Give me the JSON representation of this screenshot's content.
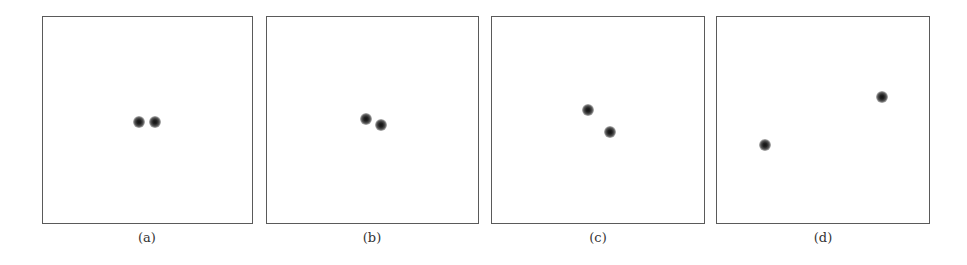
{
  "figure": {
    "panels": [
      {
        "caption": "(a)",
        "box": {
          "left": 42,
          "width": 211
        },
        "caption_x": 147,
        "points": [
          {
            "x": 139,
            "y": 122
          },
          {
            "x": 155,
            "y": 122
          }
        ]
      },
      {
        "caption": "(b)",
        "box": {
          "left": 266,
          "width": 213
        },
        "caption_x": 372,
        "points": [
          {
            "x": 366,
            "y": 119
          },
          {
            "x": 381,
            "y": 125
          }
        ]
      },
      {
        "caption": "(c)",
        "box": {
          "left": 491,
          "width": 214
        },
        "caption_x": 598,
        "points": [
          {
            "x": 588,
            "y": 110
          },
          {
            "x": 610,
            "y": 132
          }
        ]
      },
      {
        "caption": "(d)",
        "box": {
          "left": 716,
          "width": 214
        },
        "caption_x": 823,
        "points": [
          {
            "x": 765,
            "y": 145
          },
          {
            "x": 882,
            "y": 97
          }
        ]
      }
    ],
    "colors": {
      "border": "#5a5a5a",
      "dot": "#111111",
      "background": "#ffffff"
    }
  }
}
